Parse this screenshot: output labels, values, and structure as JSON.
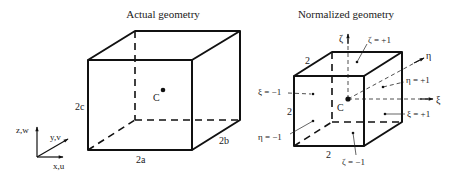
{
  "left_panel": {
    "title": "Actual geometry",
    "center_label": "C",
    "dimensions": {
      "height": "2c",
      "width": "2a",
      "depth": "2b"
    }
  },
  "axes": {
    "z": "z,w",
    "y": "y,v",
    "x": "x,u"
  },
  "right_panel": {
    "title": "Normalized geometry",
    "center_label": "C",
    "dimensions": {
      "top_depth": "2",
      "height": "2",
      "width": "2"
    },
    "natural_axes": {
      "zeta": "ζ",
      "eta": "η",
      "xi": "ξ"
    },
    "face_labels": {
      "zeta_plus": "ζ = +1",
      "zeta_minus": "ζ = −1",
      "eta_plus": "η = +1",
      "eta_minus": "η = −1",
      "xi_plus": "ξ = +1",
      "xi_minus": "ξ = −1"
    }
  },
  "colors": {
    "line": "#111111",
    "background": "#ffffff"
  }
}
